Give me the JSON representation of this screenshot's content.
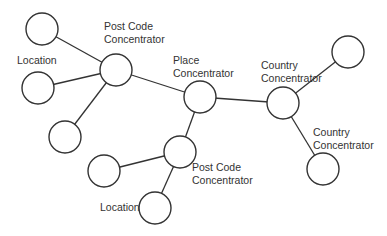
{
  "diagram": {
    "colors": {
      "stroke": "#333333",
      "fill": "#ffffff",
      "text": "#333333"
    },
    "nodes": [
      {
        "id": "n1",
        "x": 42,
        "y": 29
      },
      {
        "id": "n2",
        "x": 38,
        "y": 88
      },
      {
        "id": "n3",
        "x": 116,
        "y": 70
      },
      {
        "id": "n4",
        "x": 65,
        "y": 137
      },
      {
        "id": "n5",
        "x": 200,
        "y": 97
      },
      {
        "id": "n6",
        "x": 283,
        "y": 103
      },
      {
        "id": "n7",
        "x": 348,
        "y": 52
      },
      {
        "id": "n8",
        "x": 323,
        "y": 169
      },
      {
        "id": "n9",
        "x": 180,
        "y": 152
      },
      {
        "id": "n10",
        "x": 104,
        "y": 171
      },
      {
        "id": "n11",
        "x": 155,
        "y": 208
      }
    ],
    "edges": [
      [
        "n1",
        "n3"
      ],
      [
        "n2",
        "n3"
      ],
      [
        "n4",
        "n3"
      ],
      [
        "n3",
        "n5"
      ],
      [
        "n5",
        "n6"
      ],
      [
        "n6",
        "n7"
      ],
      [
        "n6",
        "n8"
      ],
      [
        "n5",
        "n9"
      ],
      [
        "n10",
        "n9"
      ],
      [
        "n9",
        "n11"
      ]
    ],
    "labels": {
      "postcode_top_1": "Post Code",
      "postcode_top_2": "Concentrator",
      "location_left": "Location",
      "place_1": "Place",
      "place_2": "Concentrator",
      "country_1": "Country",
      "country_2": "Concentrator",
      "country_lower_1": "Country",
      "country_lower_2": "Concentrator",
      "postcode_lower_1": "Post Code",
      "postcode_lower_2": "Concentrator",
      "location_bottom": "Location"
    }
  }
}
